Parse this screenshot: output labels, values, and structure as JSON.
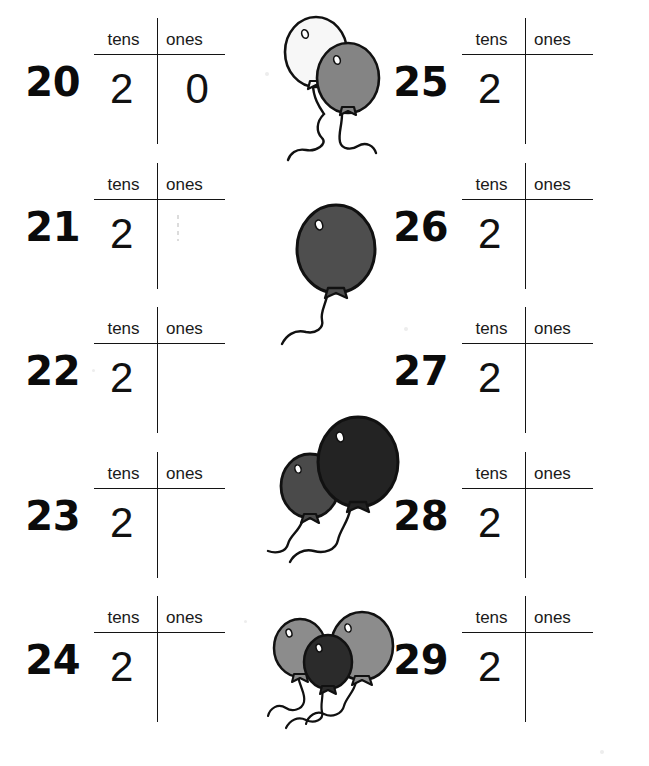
{
  "worksheet": {
    "title": "Place Value: tens and ones (20-29)",
    "column_headers": {
      "tens": "tens",
      "ones": "ones"
    },
    "left_column": [
      {
        "number": "20",
        "tens": "2",
        "ones": "0"
      },
      {
        "number": "21",
        "tens": "2",
        "ones": ""
      },
      {
        "number": "22",
        "tens": "2",
        "ones": ""
      },
      {
        "number": "23",
        "tens": "2",
        "ones": ""
      },
      {
        "number": "24",
        "tens": "2",
        "ones": ""
      }
    ],
    "right_column": [
      {
        "number": "25",
        "tens": "2",
        "ones": ""
      },
      {
        "number": "26",
        "tens": "2",
        "ones": ""
      },
      {
        "number": "27",
        "tens": "2",
        "ones": ""
      },
      {
        "number": "28",
        "tens": "2",
        "ones": ""
      },
      {
        "number": "29",
        "tens": "2",
        "ones": ""
      }
    ]
  },
  "illustrations": [
    {
      "name": "balloon-pair-white-gray",
      "count": 2,
      "colors": [
        "#f7f7f7",
        "#848484"
      ]
    },
    {
      "name": "balloon-single-dark-gray",
      "count": 1,
      "colors": [
        "#4e4e4e"
      ]
    },
    {
      "name": "balloon-pair-gray-black",
      "count": 2,
      "colors": [
        "#4a4a4a",
        "#232323"
      ]
    },
    {
      "name": "balloon-trio-gray-black-gray",
      "count": 3,
      "colors": [
        "#8c8c8c",
        "#2b2b2b",
        "#8c8c8c"
      ]
    }
  ],
  "colors": {
    "ink": "#111111",
    "rule": "#141414",
    "paper": "#ffffff"
  }
}
